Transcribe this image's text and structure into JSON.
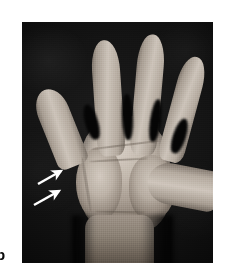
{
  "figure": {
    "panel_label": "b",
    "background_color": "#ffffff"
  },
  "photo": {
    "name": "clinical-photograph-open-palm",
    "description": "Clinical photograph of an open right hand, palmar view, against a black background",
    "background_color": "#000000",
    "frame": {
      "left": 22,
      "top": 22,
      "width": 191,
      "height": 241
    }
  },
  "anatomy": {
    "parts": [
      {
        "id": "index-finger",
        "label": "Index finger"
      },
      {
        "id": "middle-finger",
        "label": "Middle finger"
      },
      {
        "id": "ring-finger",
        "label": "Ring finger"
      },
      {
        "id": "little-finger",
        "label": "Little finger"
      },
      {
        "id": "thumb",
        "label": "Thumb"
      },
      {
        "id": "palm",
        "label": "Palm"
      },
      {
        "id": "thenar",
        "label": "Thenar eminence"
      },
      {
        "id": "hypothenar",
        "label": "Hypothenar eminence"
      },
      {
        "id": "wrist",
        "label": "Wrist and distal forearm"
      }
    ]
  },
  "annotations": {
    "arrow_color": "#ffffff",
    "arrows": [
      {
        "id": "arrow-upper",
        "tail": [
          38,
          184
        ],
        "head": [
          63,
          171
        ]
      },
      {
        "id": "arrow-lower",
        "tail": [
          34,
          205
        ],
        "head": [
          61,
          191
        ]
      }
    ],
    "count": 2
  }
}
